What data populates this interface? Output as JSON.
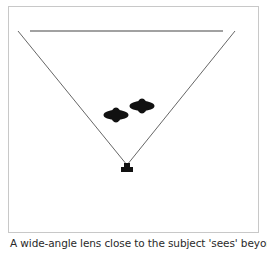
{
  "figure": {
    "caption": "A wide-angle lens close to the subject 'sees' beyond the",
    "colors": {
      "frame_border": "#c8c8c8",
      "lines": "#555555",
      "background_line": "#444444",
      "subjects": "#111111",
      "camera": "#111111"
    },
    "elements": {
      "background_line": {
        "x1": 30,
        "y1": 31,
        "x2": 223,
        "y2": 31
      },
      "view_left": {
        "x1": 18,
        "y1": 31,
        "x2": 127,
        "y2": 165
      },
      "view_right": {
        "x1": 235,
        "y1": 31,
        "x2": 127,
        "y2": 165
      },
      "subjects": [
        {
          "label": "subject-1",
          "cx": 116,
          "cy": 115
        },
        {
          "label": "subject-2",
          "cx": 142,
          "cy": 106
        }
      ],
      "camera": {
        "cx": 127,
        "cy": 168
      }
    }
  }
}
